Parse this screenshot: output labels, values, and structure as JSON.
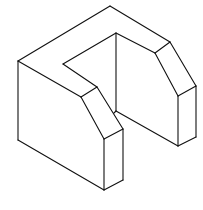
{
  "figure": {
    "stroke_color": "#111111",
    "background": "#ffffff",
    "edges": [
      {
        "name": "top-left-edge",
        "x1": 18,
        "y1": 61,
        "x2": 110,
        "y2": 6
      },
      {
        "name": "top-right-edge",
        "x1": 110,
        "y1": 6,
        "x2": 170,
        "y2": 42
      },
      {
        "name": "left-vertical-edge",
        "x1": 18,
        "y1": 61,
        "x2": 18,
        "y2": 140
      },
      {
        "name": "left-bottom-edge",
        "x1": 18,
        "y1": 140,
        "x2": 104,
        "y2": 190
      },
      {
        "name": "left-top-front-edge",
        "x1": 18,
        "y1": 61,
        "x2": 81,
        "y2": 97
      },
      {
        "name": "front-chamfer-top",
        "x1": 81,
        "y1": 97,
        "x2": 97,
        "y2": 87
      },
      {
        "name": "front-chamfer-left",
        "x1": 81,
        "y1": 97,
        "x2": 104,
        "y2": 139
      },
      {
        "name": "front-chamfer-right",
        "x1": 97,
        "y1": 87,
        "x2": 123,
        "y2": 129
      },
      {
        "name": "front-chamfer-bottom",
        "x1": 104,
        "y1": 139,
        "x2": 123,
        "y2": 129
      },
      {
        "name": "front-vertical-left",
        "x1": 104,
        "y1": 139,
        "x2": 104,
        "y2": 190
      },
      {
        "name": "front-vertical-right",
        "x1": 123,
        "y1": 129,
        "x2": 123,
        "y2": 180
      },
      {
        "name": "front-bottom-edge",
        "x1": 104,
        "y1": 190,
        "x2": 123,
        "y2": 180
      },
      {
        "name": "slot-inner-left-edge",
        "x1": 63,
        "y1": 64,
        "x2": 97,
        "y2": 87
      },
      {
        "name": "slot-inner-back-edge",
        "x1": 63,
        "y1": 64,
        "x2": 116,
        "y2": 33
      },
      {
        "name": "slot-back-vertical",
        "x1": 116,
        "y1": 33,
        "x2": 116,
        "y2": 111
      },
      {
        "name": "slot-inner-right-top",
        "x1": 116,
        "y1": 33,
        "x2": 155,
        "y2": 53
      },
      {
        "name": "slot-floor-edge",
        "x1": 116,
        "y1": 111,
        "x2": 178,
        "y2": 146
      },
      {
        "name": "slot-floor-front",
        "x1": 114,
        "y1": 113,
        "x2": 116,
        "y2": 111
      },
      {
        "name": "right-chamfer-top",
        "x1": 155,
        "y1": 53,
        "x2": 170,
        "y2": 42
      },
      {
        "name": "right-chamfer-left",
        "x1": 155,
        "y1": 53,
        "x2": 178,
        "y2": 96
      },
      {
        "name": "right-chamfer-right",
        "x1": 170,
        "y1": 42,
        "x2": 196,
        "y2": 86
      },
      {
        "name": "right-chamfer-bottom",
        "x1": 178,
        "y1": 96,
        "x2": 196,
        "y2": 86
      },
      {
        "name": "right-vertical-left",
        "x1": 178,
        "y1": 96,
        "x2": 178,
        "y2": 146
      },
      {
        "name": "right-vertical-right",
        "x1": 196,
        "y1": 86,
        "x2": 196,
        "y2": 137
      },
      {
        "name": "right-bottom-edge",
        "x1": 178,
        "y1": 146,
        "x2": 196,
        "y2": 137
      }
    ]
  }
}
